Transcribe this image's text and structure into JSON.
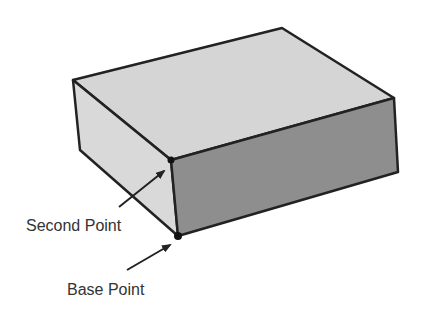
{
  "diagram": {
    "colors": {
      "background": "#ffffff",
      "top_face": "#d5d5d5",
      "left_face": "#d9d9d9",
      "right_face": "#8e8e8e",
      "edge": "#222222",
      "point": "#111111",
      "arrow": "#222222",
      "text": "#333333"
    },
    "labels": {
      "second_point": "Second Point",
      "base_point": "Base Point"
    }
  }
}
